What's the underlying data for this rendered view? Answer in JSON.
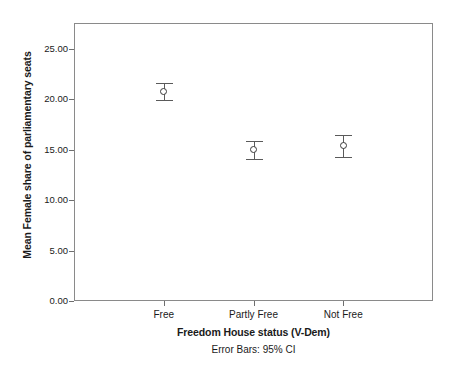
{
  "chart_data": {
    "type": "scatter",
    "title": "",
    "subtitle": "",
    "xlabel": "Freedom House status (V-Dem)",
    "ylabel": "Mean Female share of parliamentary seats",
    "footnote": "Error Bars: 95% CI",
    "categories": [
      "Free",
      "Partly Free",
      "Not Free"
    ],
    "values": [
      20.8,
      15.0,
      15.4
    ],
    "error_low": [
      19.9,
      14.1,
      14.3
    ],
    "error_high": [
      21.6,
      15.9,
      16.5
    ],
    "ylim": [
      0.0,
      27.5
    ],
    "yticks": [
      0.0,
      5.0,
      10.0,
      15.0,
      20.0,
      25.0
    ],
    "ytick_labels": [
      "0.00",
      "5.00",
      "10.00",
      "15.00",
      "20.00",
      "25.00"
    ],
    "grid": false,
    "legend": "none",
    "marker": "open-circle",
    "series": [
      {
        "name": "Mean Female share of parliamentary seats",
        "points": [
          {
            "category": "Free",
            "mean": 20.8,
            "ci_low": 19.9,
            "ci_high": 21.6
          },
          {
            "category": "Partly Free",
            "mean": 15.0,
            "ci_low": 14.1,
            "ci_high": 15.9
          },
          {
            "category": "Not Free",
            "mean": 15.4,
            "ci_low": 14.3,
            "ci_high": 16.5
          }
        ]
      }
    ],
    "colors": {
      "background": "#ffffff",
      "frame": "#8a8a8a",
      "tick": "#6e6e6e",
      "errorbar": "#5a5a5a",
      "marker_edge": "#3a3a3a",
      "marker_fill": "#ffffff",
      "text": "#1a1a1a"
    }
  }
}
